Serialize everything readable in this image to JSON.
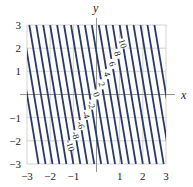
{
  "chart_data": {
    "type": "contour",
    "title": "",
    "xlabel": "x",
    "ylabel": "y",
    "xlim": [
      -3,
      3
    ],
    "ylim": [
      -3,
      3
    ],
    "grid": true,
    "x_ticks": [
      "-3",
      "-2",
      "-1",
      "1",
      "2",
      "3"
    ],
    "y_ticks": [
      "3",
      "2",
      "1",
      "-1",
      "-2",
      "-3"
    ],
    "levels": [
      -10,
      -8,
      -6,
      -4,
      -2,
      0,
      2,
      4,
      6,
      8,
      10
    ],
    "level_labels": [
      "-10",
      "-8",
      "-6",
      "-4",
      "-2",
      "0",
      "2",
      "4",
      "6",
      "8",
      "10"
    ],
    "line_color": "#2b3a67",
    "grid_color": "#c8c8c8"
  }
}
